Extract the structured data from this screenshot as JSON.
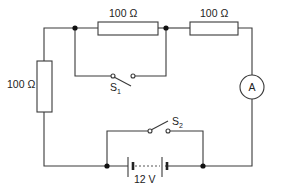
{
  "diagram": {
    "type": "circuit",
    "components": {
      "resistor_top_left": {
        "label": "100 Ω"
      },
      "resistor_top_right": {
        "label": "100 Ω"
      },
      "resistor_left": {
        "label": "100 Ω"
      },
      "ammeter": {
        "label": "A"
      },
      "switch_1": {
        "label": "S",
        "subscript": "1",
        "state": "open"
      },
      "switch_2": {
        "label": "S",
        "subscript": "2",
        "state": "open"
      },
      "battery": {
        "label": "12 V"
      }
    }
  }
}
